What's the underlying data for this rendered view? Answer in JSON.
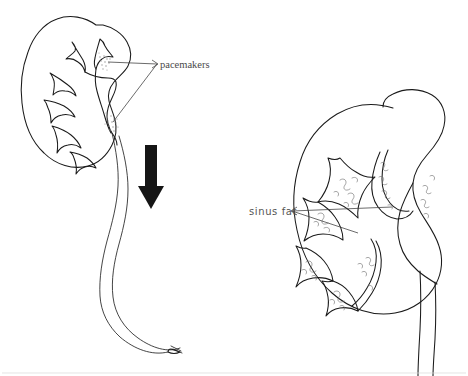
{
  "figure": {
    "background_color": "#ffffff",
    "ink_color": "#1a1a1a",
    "width": 468,
    "height": 376
  },
  "labels": {
    "pacemakers": {
      "text": "pacemakers",
      "style": "serif",
      "x": 160,
      "y": 71,
      "leader_count": 2,
      "points_to": "two stippled regions in the left kidney renal pelvis"
    },
    "sinus_fat": {
      "text": "sinus fat",
      "style": "geometric-sans",
      "x": 249,
      "y": 215,
      "leader_count": 2,
      "points_to": "squiggle-filled regions around the right kidney calyces"
    }
  },
  "structures": {
    "left_kidney": {
      "name": "left kidney with pelvis and long ureter",
      "features": [
        "cortex outline",
        "major calyces",
        "minor calyces",
        "renal pelvis",
        "pacemaker stipple sites",
        "long wavy ureter"
      ]
    },
    "right_kidney": {
      "name": "right kidney coronal section",
      "features": [
        "cortex outline",
        "branching calyces",
        "renal sinus fat",
        "renal pelvis",
        "ureter"
      ]
    },
    "arrow": {
      "name": "downward flow arrow",
      "direction": "down",
      "color": "#151515"
    }
  }
}
